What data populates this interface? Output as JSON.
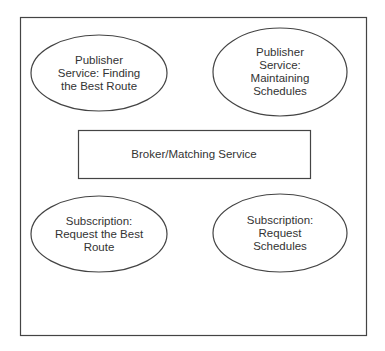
{
  "diagram": {
    "colors": {
      "stroke": "#444444",
      "text": "#333333",
      "background": "#ffffff"
    },
    "frame": {
      "x": 20,
      "y": 17,
      "w": 347,
      "h": 319
    },
    "nodes": [
      {
        "id": "publisher-best-route",
        "shape": "ellipse",
        "cx": 99,
        "cy": 73,
        "rx": 68,
        "ry": 38,
        "lines": [
          "Publisher",
          "Service: Finding",
          "the Best Route"
        ]
      },
      {
        "id": "publisher-schedules",
        "shape": "ellipse",
        "cx": 280,
        "cy": 72,
        "rx": 67,
        "ry": 44,
        "lines": [
          "Publisher",
          "Service:",
          "Maintaining",
          "Schedules"
        ]
      },
      {
        "id": "broker",
        "shape": "rect",
        "x": 78,
        "y": 130,
        "w": 232,
        "h": 48,
        "lines": [
          "Broker/Matching Service"
        ]
      },
      {
        "id": "subscription-best-route",
        "shape": "ellipse",
        "cx": 99,
        "cy": 234,
        "rx": 68,
        "ry": 38,
        "lines": [
          "Subscription:",
          "Request the Best",
          "Route"
        ]
      },
      {
        "id": "subscription-schedules",
        "shape": "ellipse",
        "cx": 280,
        "cy": 233,
        "rx": 67,
        "ry": 39,
        "lines": [
          "Subscription:",
          "Request",
          "Schedules"
        ]
      }
    ]
  }
}
